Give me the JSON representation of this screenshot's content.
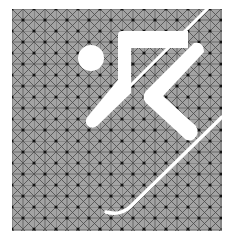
{
  "image": {
    "subject": "alpine skiing pictogram",
    "description": "White stylized skier figure with ski on gray grid-patterned square"
  },
  "colors": {
    "background": "#ffffff",
    "panel": "#a3a3a3",
    "grid_line": "#4a4a4a",
    "grid_dot": "#111111",
    "figure": "#ffffff"
  },
  "panel": {
    "x": 12,
    "y": 9,
    "width": 210,
    "height": 222,
    "cell": 22
  },
  "figure": {
    "head": {
      "cx": 91,
      "cy": 58,
      "r": 13
    }
  }
}
